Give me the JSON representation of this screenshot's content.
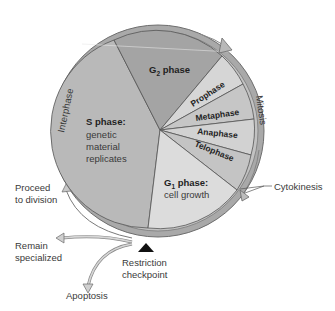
{
  "diagram": {
    "ring_labels": {
      "interphase": "Interphase",
      "mitosis": "Mitosis"
    },
    "phases": [
      {
        "id": "s",
        "title": "S phase:",
        "lines": [
          "genetic",
          "material",
          "replicates"
        ],
        "color": "#b9b9b9"
      },
      {
        "id": "g2",
        "title_main": "G",
        "title_sub": "2",
        "title_rest": " phase",
        "color": "#a4a4a4"
      },
      {
        "id": "prophase",
        "title": "Prophase",
        "color": "#d6d6d6"
      },
      {
        "id": "metaphase",
        "title": "Metaphase",
        "color": "#c6c6c6"
      },
      {
        "id": "anaphase",
        "title": "Anaphase",
        "color": "#d2d2d2"
      },
      {
        "id": "telophase",
        "title": "Telophase",
        "color": "#c4c4c4"
      },
      {
        "id": "g1",
        "title_main": "G",
        "title_sub": "1",
        "title_rest": " phase:",
        "lines": [
          "cell growth"
        ],
        "color": "#dcdcdc"
      }
    ],
    "callouts": {
      "cytokinesis": "Cytokinesis",
      "proceed": [
        "Proceed",
        "to division"
      ],
      "remain": [
        "Remain",
        "specialized"
      ],
      "apoptosis": "Apoptosis",
      "restriction": [
        "Restriction",
        "checkpoint"
      ]
    },
    "colors": {
      "ring": "#a9a9a9",
      "ring_inner": "#c2c2c2",
      "outline": "#555555",
      "text": "#3a3a3a",
      "checkpoint": "#111111"
    }
  }
}
